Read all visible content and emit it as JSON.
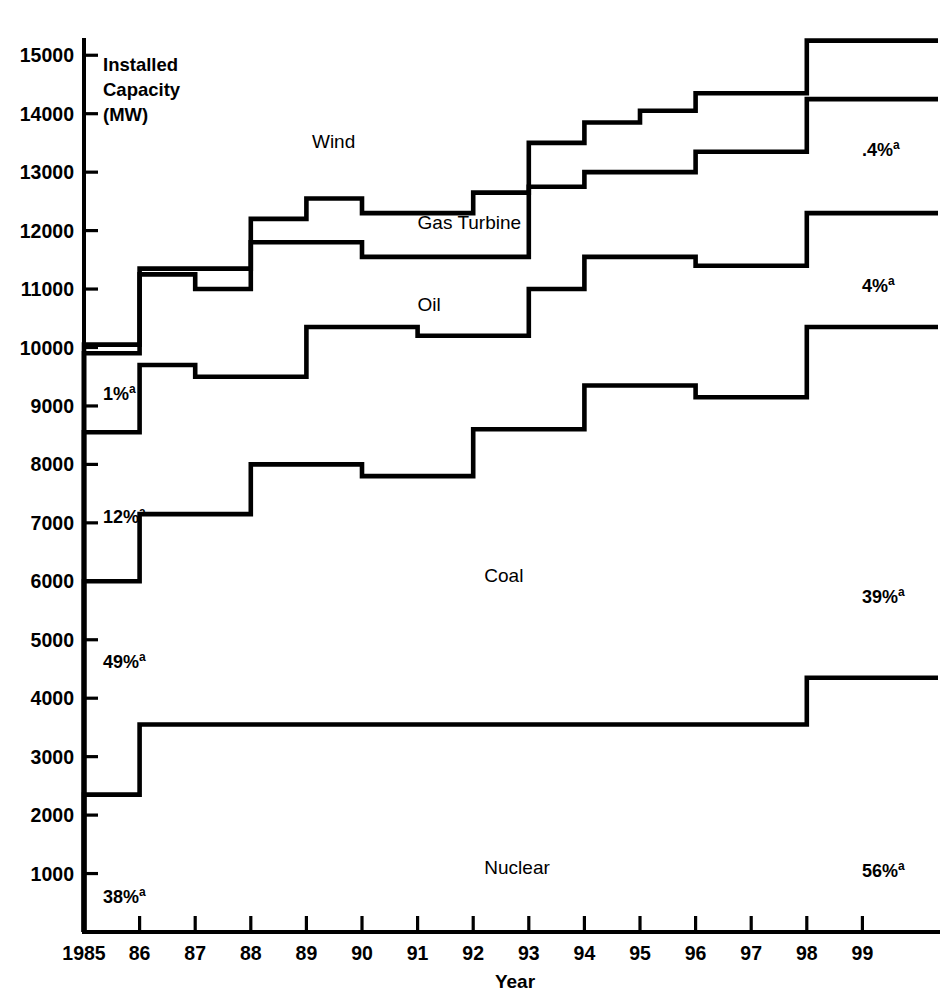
{
  "chart_data": {
    "type": "line",
    "subtype": "step-stacked-cumulative",
    "title": "",
    "xlabel": "Year",
    "ylabel": "Installed Capacity (MW)",
    "ylabel_lines": [
      "Installed",
      "Capacity",
      "(MW)"
    ],
    "x": [
      1985,
      1986,
      1987,
      1988,
      1989,
      1990,
      1991,
      1992,
      1993,
      1994,
      1995,
      1996,
      1997,
      1998,
      1999
    ],
    "xtick_labels": [
      "1985",
      "86",
      "87",
      "88",
      "89",
      "90",
      "91",
      "92",
      "93",
      "94",
      "95",
      "96",
      "97",
      "98",
      "99"
    ],
    "ytick_labels": [
      "15000",
      "14000",
      "13000",
      "12000",
      "11000",
      "10000",
      "9000",
      "8000",
      "7000",
      "6000",
      "5000",
      "4000",
      "3000",
      "2000",
      "1000"
    ],
    "ytick_values": [
      15000,
      14000,
      13000,
      12000,
      11000,
      10000,
      9000,
      8000,
      7000,
      6000,
      5000,
      4000,
      3000,
      2000,
      1000
    ],
    "ylim": [
      0,
      15600
    ],
    "xlim": [
      1985,
      2000
    ],
    "grid": false,
    "legend": "inline-labels",
    "series": [
      {
        "name": "Nuclear",
        "label_x": 1992.2,
        "label_y": 1000,
        "pct_left": "38%",
        "pct_right": "56%",
        "values": [
          2350,
          3550,
          3550,
          3550,
          3550,
          3550,
          3550,
          3550,
          3550,
          3550,
          3550,
          3550,
          3550,
          4350,
          4350
        ]
      },
      {
        "name": "Coal",
        "label_x": 1992.2,
        "label_y": 5980,
        "pct_left": "12%",
        "pct_right": "39%",
        "values": [
          6000,
          7150,
          7150,
          8000,
          8000,
          7800,
          7800,
          8600,
          8600,
          9350,
          9350,
          9150,
          9150,
          10350,
          10350
        ]
      },
      {
        "name": "Oil",
        "label_x": 1991.0,
        "label_y": 10630,
        "pct_left": "1%",
        "pct_right": "4%",
        "values": [
          8550,
          9700,
          9500,
          9500,
          10350,
          10350,
          10200,
          10200,
          11000,
          11550,
          11550,
          11400,
          11400,
          12300,
          12300
        ]
      },
      {
        "name": "Gas Turbine",
        "label_x": 1991.0,
        "label_y": 12030,
        "pct_left": "",
        "pct_right": ".4%",
        "values": [
          9900,
          11250,
          11000,
          11800,
          11800,
          11550,
          11550,
          11550,
          12750,
          13000,
          13000,
          13350,
          13350,
          14250,
          14250
        ]
      },
      {
        "name": "Wind",
        "label_x": 1989.1,
        "label_y": 13420,
        "pct_left": "",
        "pct_right": "",
        "values": [
          10050,
          11350,
          11350,
          12200,
          12550,
          12300,
          12300,
          12650,
          13500,
          13850,
          14050,
          14350,
          14350,
          15250,
          15250
        ]
      }
    ],
    "footnote_marker": "a"
  },
  "annotations": {
    "left_percents": [
      {
        "series": "Oil",
        "text": "1%",
        "sup": "a"
      },
      {
        "series": "Coal",
        "text": "12%",
        "sup": "a"
      },
      {
        "series": "Nuclear-upper",
        "text": "49%",
        "sup": "a"
      },
      {
        "series": "Nuclear",
        "text": "38%",
        "sup": "a"
      }
    ],
    "right_percents": [
      {
        "series": "Gas Turbine",
        "text": ".4%",
        "sup": "a"
      },
      {
        "series": "Oil",
        "text": "4%",
        "sup": "a"
      },
      {
        "series": "Coal",
        "text": "39%",
        "sup": "a"
      },
      {
        "series": "Nuclear",
        "text": "56%",
        "sup": "a"
      }
    ]
  },
  "colors": {
    "ink": "#000000",
    "background": "#ffffff"
  }
}
